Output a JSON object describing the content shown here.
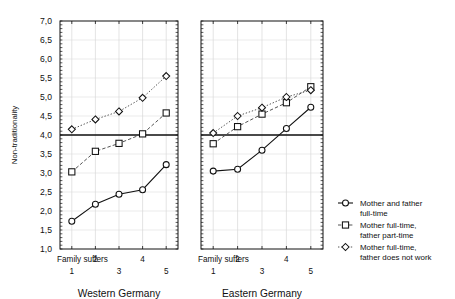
{
  "chart_data": {
    "type": "line",
    "title": "",
    "ylabel": "Non-traditionality",
    "xlabel": "",
    "ylim": [
      1.0,
      7.0
    ],
    "ytick_labels": [
      "7,0",
      "6,5",
      "6,0",
      "5,5",
      "5,0",
      "4,5",
      "4,0",
      "3,5",
      "3,0",
      "2,5",
      "2,0",
      "1,5",
      "1,0"
    ],
    "ytick_values": [
      7.0,
      6.5,
      6.0,
      5.5,
      5.0,
      4.5,
      4.0,
      3.5,
      3.0,
      2.5,
      2.0,
      1.5,
      1.0
    ],
    "grid": true,
    "reference_line": 4.0,
    "x_axis_caption": "Family suffers",
    "xtick_labels": [
      "1",
      "2",
      "3",
      "4",
      "5"
    ],
    "x": [
      1,
      2,
      3,
      4,
      5
    ],
    "legend_position": "right",
    "panels": [
      {
        "name": "Western Germany",
        "series": [
          {
            "name": "Mother and father full-time",
            "marker": "circle",
            "linestyle": "solid",
            "values": [
              1.73,
              2.18,
              2.44,
              2.56,
              3.22
            ]
          },
          {
            "name": "Mother full-time, father part-time",
            "marker": "square",
            "linestyle": "dashed",
            "values": [
              3.03,
              3.57,
              3.78,
              4.03,
              4.58
            ]
          },
          {
            "name": "Mother full-time, father does not work",
            "marker": "diamond",
            "linestyle": "dotted",
            "values": [
              4.15,
              4.41,
              4.62,
              4.98,
              5.55
            ]
          }
        ]
      },
      {
        "name": "Eastern Germany",
        "series": [
          {
            "name": "Mother and father full-time",
            "marker": "circle",
            "linestyle": "solid",
            "values": [
              3.05,
              3.1,
              3.6,
              4.17,
              4.73
            ]
          },
          {
            "name": "Mother full-time, father part-time",
            "marker": "square",
            "linestyle": "dashed",
            "values": [
              3.77,
              4.22,
              4.55,
              4.85,
              5.27
            ]
          },
          {
            "name": "Mother full-time, father does not work",
            "marker": "diamond",
            "linestyle": "dotted",
            "values": [
              4.05,
              4.5,
              4.72,
              5.0,
              5.18
            ]
          }
        ]
      }
    ],
    "legend": [
      {
        "marker": "circle",
        "linestyle": "solid",
        "line1": "Mother and father",
        "line2": "full-time"
      },
      {
        "marker": "square",
        "linestyle": "dashed",
        "line1": "Mother full-time,",
        "line2": "father part-time"
      },
      {
        "marker": "diamond",
        "linestyle": "dotted",
        "line1": "Mother full-time,",
        "line2": "father does not work"
      }
    ],
    "colors": {
      "foreground": "#111111",
      "grid": "#d9d9d9",
      "background": "#ffffff"
    }
  }
}
